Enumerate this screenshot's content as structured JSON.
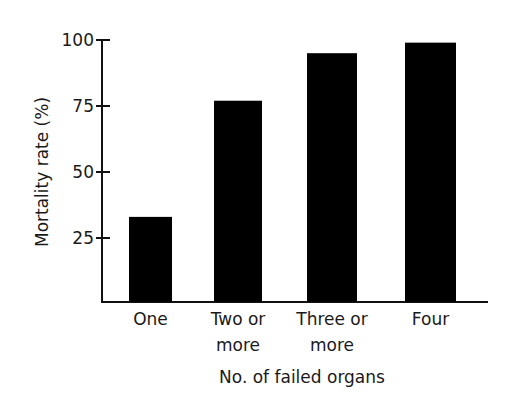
{
  "chart_data": {
    "type": "bar",
    "title": "",
    "xlabel": "No. of failed organs",
    "ylabel": "Mortality rate (%)",
    "categories": [
      "One",
      "Two or more",
      "Three or more",
      "Four"
    ],
    "category_lines": [
      [
        "One"
      ],
      [
        "Two or",
        "more"
      ],
      [
        "Three or",
        "more"
      ],
      [
        "Four"
      ]
    ],
    "values": [
      33,
      77,
      95,
      99
    ],
    "ylim": [
      0,
      100
    ],
    "yticks": [
      25,
      50,
      75,
      100
    ],
    "grid": false,
    "legend": null,
    "bar_color": "#000000"
  }
}
